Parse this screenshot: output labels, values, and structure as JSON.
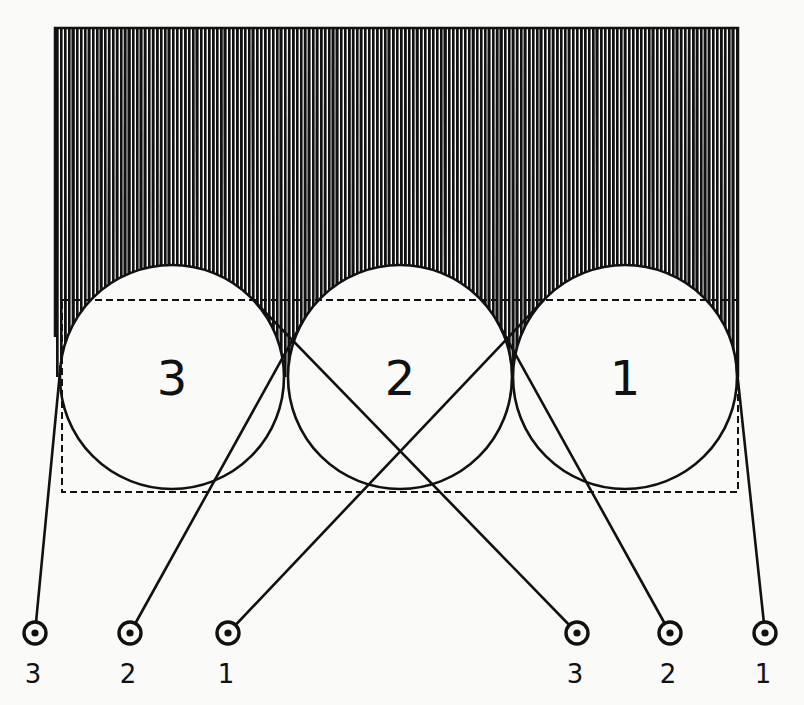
{
  "diagram": {
    "colors": {
      "ink": "#111111",
      "paper": "#fafaf8"
    },
    "block": {
      "x": 55,
      "y": 28,
      "width": 683,
      "height": 300
    },
    "dashed_box": {
      "x": 62,
      "y": 300,
      "width": 676,
      "height": 192
    },
    "roller_radius": 112,
    "rollers": [
      {
        "label": "3",
        "cx": 172,
        "cy": 377
      },
      {
        "label": "2",
        "cx": 400,
        "cy": 377
      },
      {
        "label": "1",
        "cx": 625,
        "cy": 377
      }
    ],
    "pulley_y": 633,
    "pulleys_left": [
      {
        "label": "3",
        "x": 35
      },
      {
        "label": "2",
        "x": 130
      },
      {
        "label": "1",
        "x": 228
      }
    ],
    "pulleys_right": [
      {
        "label": "3",
        "x": 577
      },
      {
        "label": "2",
        "x": 670
      },
      {
        "label": "1",
        "x": 765
      }
    ]
  }
}
